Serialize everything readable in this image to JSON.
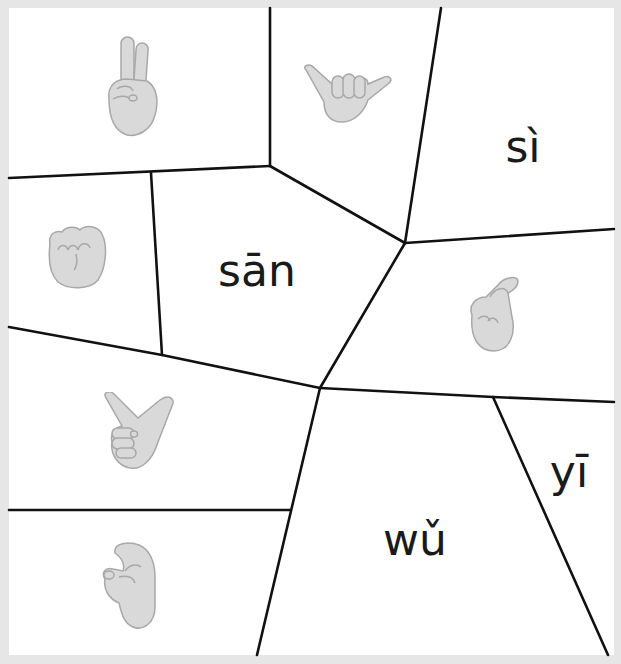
{
  "puzzle": {
    "pieces": [
      {
        "id": "p1",
        "type": "hand",
        "gesture": "two-fingers-victory",
        "meaning": "2"
      },
      {
        "id": "p2",
        "type": "hand",
        "gesture": "thumb-pinky-out",
        "meaning": "6"
      },
      {
        "id": "p3",
        "type": "text",
        "label": "sì"
      },
      {
        "id": "p4",
        "type": "hand",
        "gesture": "fist",
        "meaning": "10"
      },
      {
        "id": "p5",
        "type": "text",
        "label": "sān"
      },
      {
        "id": "p6",
        "type": "hand",
        "gesture": "crossed-fingers",
        "meaning": "10"
      },
      {
        "id": "p7",
        "type": "hand",
        "gesture": "thumb-index-out",
        "meaning": "8"
      },
      {
        "id": "p8",
        "type": "text",
        "label": "wǔ"
      },
      {
        "id": "p9",
        "type": "text",
        "label": "yī"
      },
      {
        "id": "p10",
        "type": "hand",
        "gesture": "hook-fingers",
        "meaning": "7"
      }
    ],
    "labels": {
      "si": "sì",
      "san": "sān",
      "wu": "wǔ",
      "yi": "yī"
    },
    "colors": {
      "frame": "#e6e6e6",
      "line": "#111111",
      "hand_fill": "#d9d9d9",
      "hand_stroke": "#a8a8a8",
      "text": "#1a1a1a"
    }
  }
}
